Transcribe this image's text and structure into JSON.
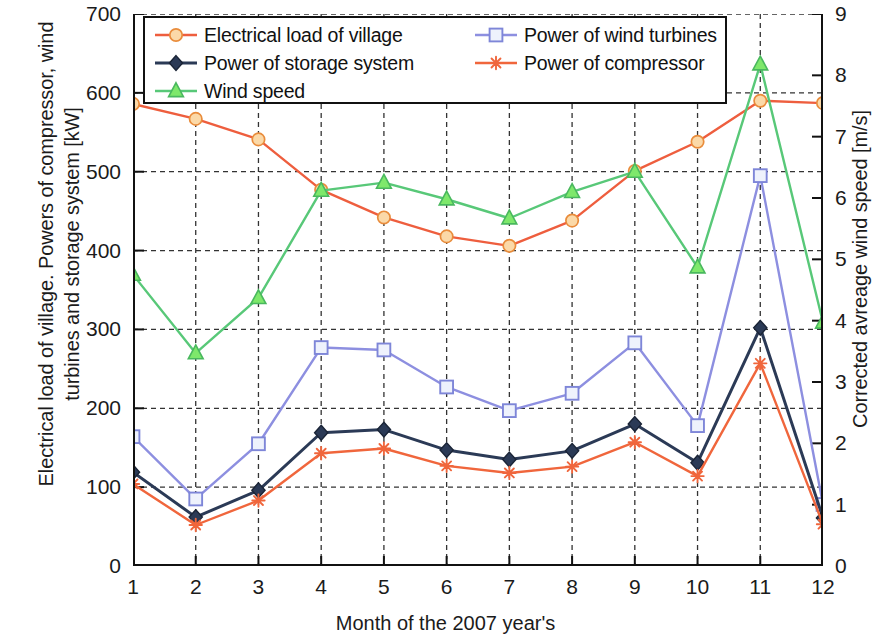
{
  "chart_data": {
    "type": "line",
    "title": "",
    "xlabel": "Month of the  2007 year's",
    "ylabel": "Electrical load of village. Powers of compressor, wind turbines and storage system [kW]",
    "ylabel_right": "Corrected avreage wind speed [m/s]",
    "categories": [
      "1",
      "2",
      "3",
      "4",
      "5",
      "6",
      "7",
      "8",
      "9",
      "10",
      "11",
      "12"
    ],
    "x": [
      1,
      2,
      3,
      4,
      5,
      6,
      7,
      8,
      9,
      10,
      11,
      12
    ],
    "ylim": [
      0,
      700
    ],
    "ylim_right": [
      0,
      9
    ],
    "yticks": [
      0,
      100,
      200,
      300,
      400,
      500,
      600,
      700
    ],
    "yticks_right": [
      0,
      1,
      2,
      3,
      4,
      5,
      6,
      7,
      8,
      9
    ],
    "grid": true,
    "legend_position": "top-left-inside",
    "series": [
      {
        "name": "Electrical load of village",
        "axis": "left",
        "color": "#EE5E3E",
        "marker": "circle",
        "marker_fill": "#FBD9A8",
        "marker_edge": "#E98C3B",
        "values": [
          586,
          567,
          541,
          477,
          442,
          418,
          406,
          438,
          501,
          538,
          590,
          587
        ]
      },
      {
        "name": "Power of wind turbines",
        "axis": "left",
        "color": "#8D8FE0",
        "marker": "square",
        "marker_fill": "#EEF2FC",
        "marker_edge": "#7E86D8",
        "values": [
          164,
          85,
          155,
          277,
          274,
          227,
          197,
          219,
          283,
          178,
          495,
          78
        ]
      },
      {
        "name": "Power of storage system",
        "axis": "left",
        "color": "#2B3A56",
        "marker": "diamond",
        "marker_fill": "#2B3A56",
        "marker_edge": "#1A2436",
        "values": [
          119,
          62,
          96,
          169,
          173,
          147,
          135,
          146,
          180,
          131,
          302,
          61
        ]
      },
      {
        "name": "Power of compressor",
        "axis": "left",
        "color": "#F0663C",
        "marker": "star",
        "marker_fill": "#F0663C",
        "marker_edge": "#F0663C",
        "values": [
          104,
          52,
          83,
          143,
          149,
          127,
          118,
          126,
          157,
          114,
          257,
          53
        ]
      },
      {
        "name": "Wind speed",
        "axis": "right",
        "color": "#58C878",
        "marker": "triangle",
        "marker_fill": "#7EE86B",
        "marker_edge": "#49B85E",
        "values": [
          4.75,
          3.47,
          4.37,
          6.12,
          6.25,
          5.98,
          5.67,
          6.1,
          6.43,
          4.87,
          8.18,
          3.97
        ]
      }
    ]
  },
  "legend": {
    "entries": [
      {
        "label": "Electrical load of village",
        "marker": "circle",
        "color": "#EE5E3E"
      },
      {
        "label": "Power of wind turbines",
        "marker": "square",
        "color": "#8D8FE0"
      },
      {
        "label": "Power of storage system",
        "marker": "diamond",
        "color": "#2B3A56"
      },
      {
        "label": "Power of compressor",
        "marker": "star",
        "color": "#F0663C"
      },
      {
        "label": "Wind speed",
        "marker": "triangle",
        "color": "#58C878"
      }
    ]
  },
  "colors": {
    "axis": "#111111",
    "grid": "#333333",
    "background": "#ffffff"
  }
}
